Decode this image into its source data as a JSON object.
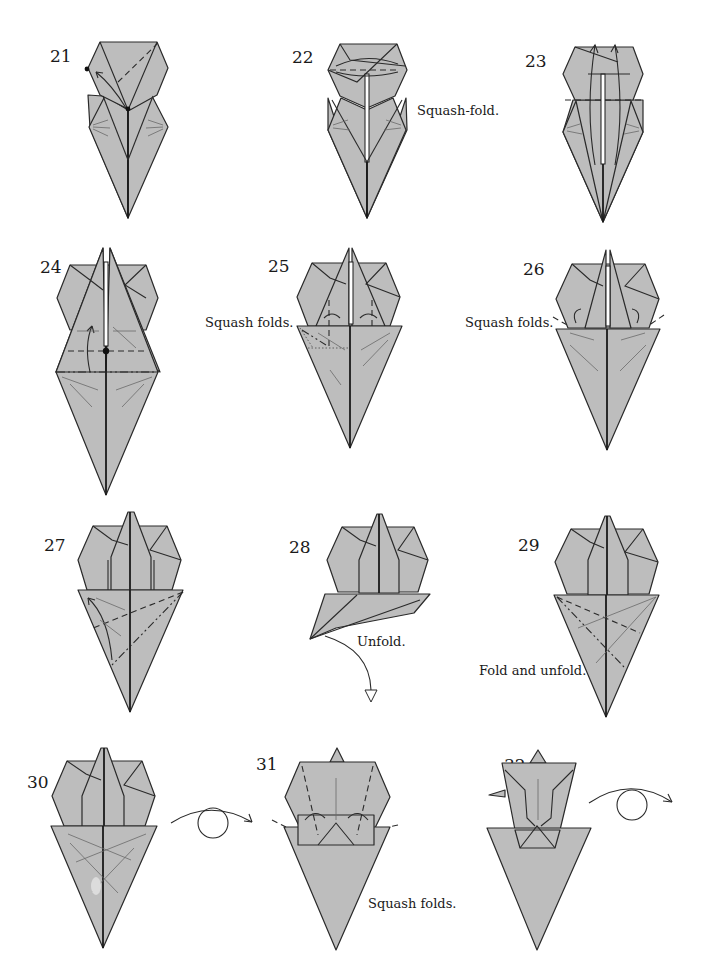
{
  "diagram": {
    "type": "origami-instructions",
    "colors": {
      "paper_fill": "#bdbdbd",
      "line": "#2a2a2a",
      "background": "#ffffff"
    },
    "steps": [
      {
        "number": "21",
        "label": ""
      },
      {
        "number": "22",
        "label": "Squash-fold."
      },
      {
        "number": "23",
        "label": ""
      },
      {
        "number": "24",
        "label": ""
      },
      {
        "number": "25",
        "label": "Squash folds."
      },
      {
        "number": "26",
        "label": "Squash folds."
      },
      {
        "number": "27",
        "label": ""
      },
      {
        "number": "28",
        "label": "Unfold."
      },
      {
        "number": "29",
        "label": "Fold and unfold."
      },
      {
        "number": "30",
        "label": "",
        "symbol": "turn-over"
      },
      {
        "number": "31",
        "label": "Squash folds."
      },
      {
        "number": "32",
        "label": "",
        "symbol": "turn-over"
      }
    ]
  }
}
